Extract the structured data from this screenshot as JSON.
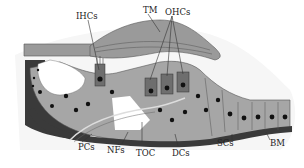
{
  "diagram": {
    "labels": {
      "tm": "TM",
      "ihcs": "IHCs",
      "ohcs": "OHCs",
      "pcs": "PCs",
      "nfs": "NFs",
      "toc": "TOC",
      "dcs": "DCs",
      "scs": "SCs",
      "bm": "BM"
    },
    "colors": {
      "tissue": "#a6a6a6",
      "membrane": "#3a3a3a",
      "hair_cell": "#6e6e6e",
      "nucleus": "#111111",
      "tectorial": "#9a9a9a",
      "background": "#ffffff"
    }
  }
}
